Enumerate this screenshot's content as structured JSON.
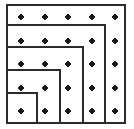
{
  "figure": {
    "canvas": {
      "width": 134,
      "height": 129
    },
    "style": {
      "background_color": "#ffffff",
      "line_color": "#2b2b2b",
      "line_width": 2,
      "dot_color": "#1a1a1a",
      "dot_radius": 2.6
    },
    "grid": {
      "rows": 5,
      "columns": 5,
      "dot_count": 25,
      "x_positions": [
        21,
        45,
        68,
        92,
        115
      ],
      "y_positions": [
        17,
        41,
        64,
        88,
        111
      ]
    },
    "squares": [
      {
        "name": "square-5x5",
        "side_units": 5,
        "x": 7,
        "y": 5,
        "size": 118
      },
      {
        "name": "square-4x4",
        "side_units": 4,
        "x": 7,
        "y": 25,
        "size": 98
      },
      {
        "name": "square-3x3",
        "side_units": 3,
        "x": 7,
        "y": 47,
        "size": 76
      },
      {
        "name": "square-2x2",
        "side_units": 2,
        "x": 7,
        "y": 70,
        "size": 53
      },
      {
        "name": "square-1x1",
        "side_units": 1,
        "x": 7,
        "y": 93,
        "size": 30
      }
    ]
  }
}
